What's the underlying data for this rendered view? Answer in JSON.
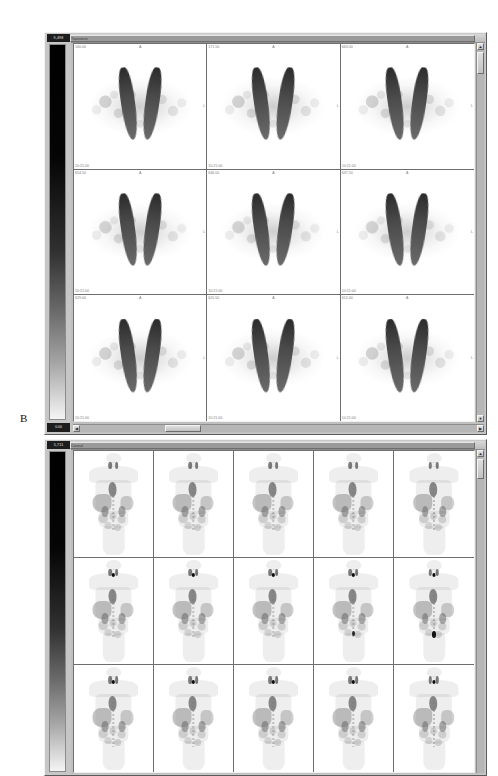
{
  "figure": {
    "panels": [
      {
        "letter": "",
        "id": "panel-a",
        "view": "transverse",
        "colorbar": {
          "top_label": "9,498",
          "bottom_label": "0.00",
          "scale": "grayscale-inverted"
        },
        "title_text": "Transverse",
        "grid": {
          "cols": 3,
          "rows": 3
        },
        "cells": [
          {
            "top_left": "160.00",
            "top_center": "A",
            "middle_right": "L",
            "bottom_left": "10:21:00"
          },
          {
            "top_left": "171.50",
            "top_center": "A",
            "middle_right": "L",
            "bottom_left": "10:21:00"
          },
          {
            "top_left": "663.00",
            "top_center": "A",
            "middle_right": "L",
            "bottom_left": "10:21:00"
          },
          {
            "top_left": "654.50",
            "top_center": "A",
            "middle_right": "L",
            "bottom_left": "10:21:00"
          },
          {
            "top_left": "646.00",
            "top_center": "A",
            "middle_right": "L",
            "bottom_left": "10:21:00"
          },
          {
            "top_left": "637.50",
            "top_center": "A",
            "middle_right": "L",
            "bottom_left": "10:21:00"
          },
          {
            "top_left": "629.00",
            "top_center": "A",
            "middle_right": "L",
            "bottom_left": "10:21:00"
          },
          {
            "top_left": "620.50",
            "top_center": "A",
            "middle_right": "L",
            "bottom_left": "10:21:00"
          },
          {
            "top_left": "612.00",
            "top_center": "A",
            "middle_right": "L",
            "bottom_left": "10:21:00"
          }
        ],
        "scrollbars": {
          "vertical": {
            "up_arrow": "▲",
            "down_arrow": "▼"
          },
          "horizontal": {
            "left_arrow": "◀",
            "right_arrow": "▶"
          }
        }
      },
      {
        "letter": "B",
        "id": "panel-b",
        "view": "coronal",
        "colorbar": {
          "top_label": "5,711",
          "bottom_label": "0.00",
          "scale": "grayscale-inverted"
        },
        "title_text": "Coronal",
        "grid": {
          "cols": 5,
          "rows": 3
        },
        "cells": [
          {
            "top_left": "",
            "top_center": "",
            "middle_right": "",
            "bottom_left": ""
          },
          {
            "top_left": "",
            "top_center": "",
            "middle_right": "",
            "bottom_left": ""
          },
          {
            "top_left": "",
            "top_center": "",
            "middle_right": "",
            "bottom_left": ""
          },
          {
            "top_left": "",
            "top_center": "",
            "middle_right": "",
            "bottom_left": ""
          },
          {
            "top_left": "",
            "top_center": "",
            "middle_right": "",
            "bottom_left": ""
          },
          {
            "top_left": "",
            "top_center": "",
            "middle_right": "",
            "bottom_left": ""
          },
          {
            "top_left": "",
            "top_center": "",
            "middle_right": "",
            "bottom_left": ""
          },
          {
            "top_left": "",
            "top_center": "",
            "middle_right": "",
            "bottom_left": ""
          },
          {
            "top_left": "",
            "top_center": "",
            "middle_right": "",
            "bottom_left": ""
          },
          {
            "top_left": "",
            "top_center": "",
            "middle_right": "",
            "bottom_left": ""
          },
          {
            "top_left": "",
            "top_center": "",
            "middle_right": "",
            "bottom_left": ""
          },
          {
            "top_left": "",
            "top_center": "",
            "middle_right": "",
            "bottom_left": ""
          },
          {
            "top_left": "",
            "top_center": "",
            "middle_right": "",
            "bottom_left": ""
          },
          {
            "top_left": "",
            "top_center": "",
            "middle_right": "",
            "bottom_left": ""
          },
          {
            "top_left": "",
            "top_center": "",
            "middle_right": "",
            "bottom_left": ""
          }
        ],
        "scrollbars": {
          "vertical": {
            "up_arrow": "▲",
            "down_arrow": "▼"
          },
          "horizontal": {
            "left_arrow": "◀",
            "right_arrow": "▶"
          }
        }
      }
    ]
  },
  "colors": {
    "chrome": "#c8c8c8",
    "image_bg": "#ffffff",
    "label_text": "#7c7c7c",
    "colorbar_label_bg": "#1d1d1d"
  }
}
